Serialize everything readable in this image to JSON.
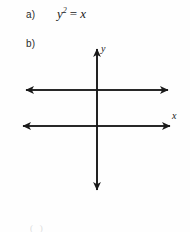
{
  "document": {
    "items": [
      {
        "label": "a)",
        "equation": {
          "base": "y",
          "exponent": "2",
          "operator": "=",
          "right": "x",
          "plain": "y2 = x"
        }
      },
      {
        "label": "b)"
      }
    ],
    "footer_clipped_text": "( )"
  },
  "figure": {
    "type": "coordinate-axes",
    "y_axis_label": "y",
    "x_axis_label": "x",
    "stroke_color": "#1a1a1a",
    "geometry": {
      "origin_x": 97,
      "vertical_axis_top_y": 8,
      "vertical_axis_bottom_y": 158,
      "upper_horizontal_y": 50,
      "upper_horizontal_x1": 24,
      "upper_horizontal_x2": 170,
      "lower_horizontal_y": 86,
      "lower_horizontal_x1": 21,
      "lower_horizontal_x2": 172
    }
  }
}
